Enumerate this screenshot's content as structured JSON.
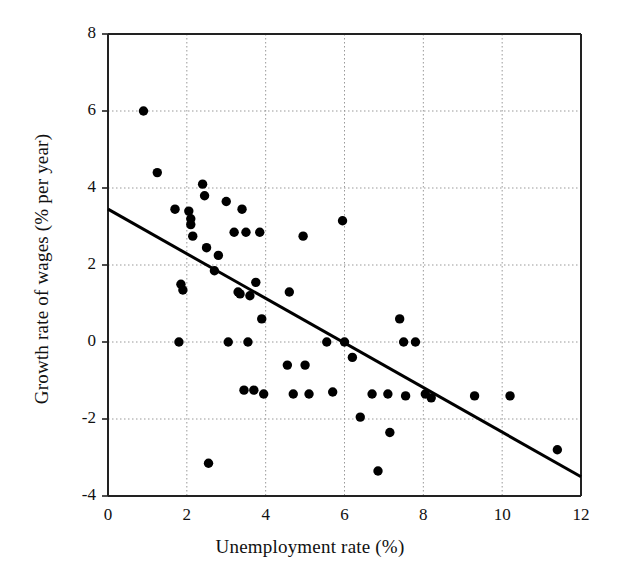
{
  "chart_data": {
    "type": "scatter",
    "title": "",
    "xlabel": "Unemployment rate (%)",
    "ylabel": "Growth rate of wages (% per year)",
    "xlim": [
      0,
      12
    ],
    "ylim": [
      -4,
      8
    ],
    "xticks": [
      0,
      2,
      4,
      6,
      8,
      10,
      12
    ],
    "yticks": [
      -4,
      -2,
      0,
      2,
      4,
      6,
      8
    ],
    "xtick_labels": [
      "0",
      "2",
      "4",
      "6",
      "8",
      "10",
      "12"
    ],
    "ytick_labels": [
      "-4",
      "-2",
      "0",
      "2",
      "4",
      "6",
      "8"
    ],
    "grid": true,
    "grid_style": "dotted",
    "grid_color": "#999999",
    "legend": "none",
    "marker": "filled-circle",
    "marker_color": "#000000",
    "marker_size": 7,
    "points": [
      {
        "x": 0.9,
        "y": 6.0
      },
      {
        "x": 1.25,
        "y": 4.4
      },
      {
        "x": 1.7,
        "y": 3.45
      },
      {
        "x": 1.8,
        "y": 0.0
      },
      {
        "x": 1.85,
        "y": 1.5
      },
      {
        "x": 1.9,
        "y": 1.35
      },
      {
        "x": 2.05,
        "y": 3.4
      },
      {
        "x": 2.1,
        "y": 3.2
      },
      {
        "x": 2.1,
        "y": 3.05
      },
      {
        "x": 2.15,
        "y": 2.75
      },
      {
        "x": 2.4,
        "y": 4.1
      },
      {
        "x": 2.45,
        "y": 3.8
      },
      {
        "x": 2.5,
        "y": 2.45
      },
      {
        "x": 2.55,
        "y": -3.15
      },
      {
        "x": 2.7,
        "y": 1.85
      },
      {
        "x": 2.8,
        "y": 2.25
      },
      {
        "x": 3.0,
        "y": 3.65
      },
      {
        "x": 3.05,
        "y": 0.0
      },
      {
        "x": 3.2,
        "y": 2.85
      },
      {
        "x": 3.3,
        "y": 1.3
      },
      {
        "x": 3.35,
        "y": 1.25
      },
      {
        "x": 3.4,
        "y": 3.45
      },
      {
        "x": 3.45,
        "y": -1.25
      },
      {
        "x": 3.5,
        "y": 2.85
      },
      {
        "x": 3.55,
        "y": 0.0
      },
      {
        "x": 3.6,
        "y": 1.2
      },
      {
        "x": 3.7,
        "y": -1.25
      },
      {
        "x": 3.75,
        "y": 1.55
      },
      {
        "x": 3.85,
        "y": 2.85
      },
      {
        "x": 3.9,
        "y": 0.6
      },
      {
        "x": 3.95,
        "y": -1.35
      },
      {
        "x": 4.55,
        "y": -0.6
      },
      {
        "x": 4.6,
        "y": 1.3
      },
      {
        "x": 4.7,
        "y": -1.35
      },
      {
        "x": 4.95,
        "y": 2.75
      },
      {
        "x": 5.0,
        "y": -0.6
      },
      {
        "x": 5.1,
        "y": -1.35
      },
      {
        "x": 5.55,
        "y": 0.0
      },
      {
        "x": 5.7,
        "y": -1.3
      },
      {
        "x": 5.95,
        "y": 3.15
      },
      {
        "x": 6.0,
        "y": 0.0
      },
      {
        "x": 6.2,
        "y": -0.4
      },
      {
        "x": 6.4,
        "y": -1.95
      },
      {
        "x": 6.7,
        "y": -1.35
      },
      {
        "x": 6.85,
        "y": -3.35
      },
      {
        "x": 7.1,
        "y": -1.35
      },
      {
        "x": 7.15,
        "y": -2.35
      },
      {
        "x": 7.4,
        "y": 0.6
      },
      {
        "x": 7.5,
        "y": 0.0
      },
      {
        "x": 7.55,
        "y": -1.4
      },
      {
        "x": 7.8,
        "y": 0.0
      },
      {
        "x": 8.05,
        "y": -1.35
      },
      {
        "x": 8.2,
        "y": -1.45
      },
      {
        "x": 9.3,
        "y": -1.4
      },
      {
        "x": 10.2,
        "y": -1.4
      },
      {
        "x": 11.4,
        "y": -2.8
      }
    ],
    "trendline": {
      "type": "linear-fit",
      "x_start": 0.0,
      "y_start": 3.45,
      "x_end": 12.0,
      "y_end": -3.5,
      "color": "#000000",
      "width": 3
    }
  }
}
